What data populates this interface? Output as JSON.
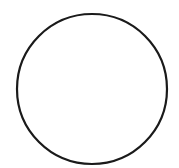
{
  "diagram": {
    "shape": "circle",
    "center": {
      "x": 92,
      "y": 89
    },
    "radius": 75,
    "stroke_color": "#1a1a1a",
    "stroke_width": 2.2,
    "fill_color": "#ffffff"
  }
}
